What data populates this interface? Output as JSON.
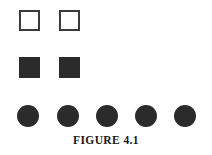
{
  "figure": {
    "caption": "FIGURE 4.1",
    "background_color": "#ffffff",
    "ink_color": "#2b2b2b",
    "outline_color": "#3b3b3b",
    "rows": [
      {
        "name": "open-squares",
        "shape": "square",
        "fill": "none",
        "count": 2,
        "items": [
          {
            "label": "open-square-1",
            "x": 19,
            "y": 10,
            "size": 21
          },
          {
            "label": "open-square-2",
            "x": 59,
            "y": 10,
            "size": 21
          }
        ]
      },
      {
        "name": "filled-squares",
        "shape": "square",
        "fill": "solid",
        "count": 2,
        "items": [
          {
            "label": "filled-square-1",
            "x": 19,
            "y": 57,
            "size": 21
          },
          {
            "label": "filled-square-2",
            "x": 59,
            "y": 57,
            "size": 21
          }
        ]
      },
      {
        "name": "filled-circles",
        "shape": "circle",
        "fill": "solid",
        "count": 5,
        "items": [
          {
            "label": "filled-circle-1",
            "x": 17,
            "y": 105,
            "size": 22
          },
          {
            "label": "filled-circle-2",
            "x": 57,
            "y": 105,
            "size": 22
          },
          {
            "label": "filled-circle-3",
            "x": 96,
            "y": 105,
            "size": 22
          },
          {
            "label": "filled-circle-4",
            "x": 135,
            "y": 105,
            "size": 22
          },
          {
            "label": "filled-circle-5",
            "x": 174,
            "y": 105,
            "size": 22
          }
        ]
      }
    ]
  }
}
